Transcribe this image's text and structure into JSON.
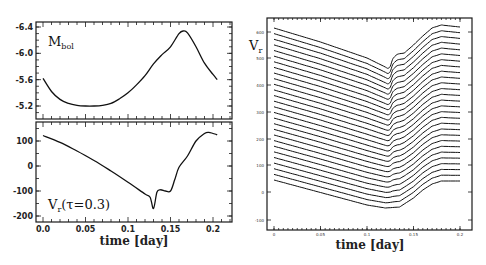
{
  "chart_data": [
    {
      "type": "line",
      "panel": "top-left",
      "label": "M_bol",
      "label_main": "M",
      "label_sub": "bol",
      "xlabel": "",
      "ylabel": "",
      "xlim": [
        -0.008,
        0.21
      ],
      "ylim": [
        -5.1,
        -6.45
      ],
      "y_inverted": true,
      "yticks": [
        "-6.4",
        "-6.0",
        "-5.6",
        "-5.2"
      ],
      "yticks_values": [
        -6.4,
        -6.0,
        -5.6,
        -5.2
      ],
      "x": [
        0.0,
        0.01,
        0.02,
        0.03,
        0.04,
        0.05,
        0.06,
        0.07,
        0.08,
        0.09,
        0.1,
        0.11,
        0.12,
        0.13,
        0.14,
        0.15,
        0.16,
        0.165,
        0.17,
        0.18,
        0.19,
        0.2,
        0.205
      ],
      "values": [
        -5.62,
        -5.42,
        -5.3,
        -5.24,
        -5.21,
        -5.2,
        -5.2,
        -5.21,
        -5.24,
        -5.31,
        -5.4,
        -5.52,
        -5.66,
        -5.84,
        -5.98,
        -6.1,
        -6.3,
        -6.34,
        -6.31,
        -6.1,
        -5.85,
        -5.68,
        -5.6
      ]
    },
    {
      "type": "line",
      "panel": "bottom-left",
      "label": "Vr(τ=0.3)",
      "label_main": "V",
      "label_sub": "r",
      "label_rest": "(τ=0.3)",
      "xlabel": "time [day]",
      "ylabel": "",
      "xlim": [
        -0.008,
        0.21
      ],
      "ylim": [
        -220,
        175
      ],
      "xticks": [
        "0.0",
        "0.05",
        "0.1",
        "0.15",
        "0.2"
      ],
      "xticks_values": [
        0.0,
        0.05,
        0.1,
        0.15,
        0.2
      ],
      "yticks": [
        "100",
        "0",
        "-100",
        "-200"
      ],
      "yticks_values": [
        100,
        0,
        -100,
        -200
      ],
      "x": [
        0.0,
        0.02,
        0.04,
        0.06,
        0.08,
        0.1,
        0.12,
        0.126,
        0.13,
        0.134,
        0.138,
        0.144,
        0.15,
        0.155,
        0.16,
        0.17,
        0.18,
        0.19,
        0.195,
        0.2,
        0.205
      ],
      "values": [
        122,
        95,
        60,
        22,
        -20,
        -65,
        -112,
        -125,
        -170,
        -105,
        -95,
        -100,
        -100,
        -55,
        -5,
        40,
        100,
        130,
        135,
        130,
        125
      ]
    },
    {
      "type": "line",
      "panel": "right",
      "label": "Vr",
      "label_main": "V",
      "label_sub": "r",
      "xlabel": "time [day]",
      "ylabel": "",
      "xticks": [
        "0",
        "0.05",
        "0.1",
        "0.15",
        "0.2"
      ],
      "yticks": [
        "600",
        "500",
        "400",
        "300",
        "200",
        "100",
        "0",
        "-100"
      ],
      "n_series": 28,
      "description": "Stacked velocity curves at successive depths, offset vertically",
      "top_series": {
        "x": [
          0.0,
          0.05,
          0.1,
          0.125,
          0.13,
          0.14,
          0.15,
          0.16,
          0.18,
          0.2
        ],
        "values": [
          612,
          545,
          470,
          430,
          455,
          470,
          500,
          545,
          620,
          610
        ]
      },
      "bottom_series": {
        "x": [
          0.0,
          0.05,
          0.1,
          0.14,
          0.16,
          0.18,
          0.2
        ],
        "values": [
          -20,
          -50,
          -85,
          -95,
          -75,
          -25,
          -25
        ]
      }
    }
  ]
}
